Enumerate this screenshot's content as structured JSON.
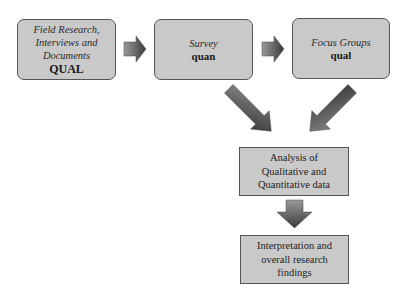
{
  "diagram": {
    "type": "mixed-methods research flow",
    "nodes": [
      {
        "id": "field",
        "line1": "Field Research,",
        "line2": "Interviews and",
        "line3": "Documents",
        "tag": "QUAL"
      },
      {
        "id": "survey",
        "line1": "Survey",
        "tag": "quan"
      },
      {
        "id": "focus",
        "line1": "Focus Groups",
        "tag": "qual"
      },
      {
        "id": "analysis",
        "line1": "Analysis of",
        "line2": "Qualitative and",
        "line3": "Quantitative data"
      },
      {
        "id": "interpretation",
        "line1": "Interpretation and",
        "line2": "overall research",
        "line3": "findings"
      }
    ],
    "edges": [
      {
        "from": "field",
        "to": "survey"
      },
      {
        "from": "survey",
        "to": "focus"
      },
      {
        "from": "survey",
        "to": "analysis"
      },
      {
        "from": "focus",
        "to": "analysis"
      },
      {
        "from": "analysis",
        "to": "interpretation"
      }
    ],
    "colors": {
      "box_fill": "#c9c9c9",
      "box_border": "#555555",
      "arrow_light": "#9a9a9a",
      "arrow_dark": "#3a3a3a"
    }
  }
}
